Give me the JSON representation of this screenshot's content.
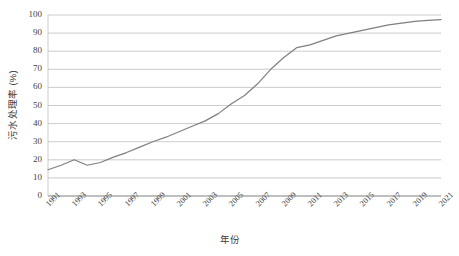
{
  "chart_data": {
    "type": "line",
    "title": "",
    "xlabel": "年份",
    "ylabel": "污水处理率 (%)",
    "ylim": [
      0,
      100
    ],
    "ytick_step": 10,
    "yticks": [
      100,
      90,
      80,
      70,
      60,
      50,
      40,
      30,
      20,
      10,
      0
    ],
    "xticks": [
      "1991",
      "1993",
      "1995",
      "1997",
      "1999",
      "2001",
      "2003",
      "2005",
      "2007",
      "2009",
      "2011",
      "2013",
      "2015",
      "2017",
      "2019",
      "2021"
    ],
    "xlim": [
      1991,
      2021
    ],
    "grid": "horizontal",
    "legend": "none",
    "series": [
      {
        "name": "污水处理率",
        "color": "#7f7f7f",
        "x": [
          1991,
          1992,
          1993,
          1994,
          1995,
          1996,
          1997,
          1998,
          1999,
          2000,
          2001,
          2002,
          2003,
          2004,
          2005,
          2006,
          2007,
          2008,
          2009,
          2010,
          2011,
          2012,
          2013,
          2014,
          2015,
          2016,
          2017,
          2018,
          2019,
          2020,
          2021
        ],
        "values": [
          14.5,
          17.0,
          20.0,
          17.0,
          18.5,
          21.5,
          24.0,
          27.0,
          30.0,
          32.5,
          35.5,
          38.5,
          41.5,
          45.5,
          51.0,
          55.5,
          62.0,
          70.0,
          76.5,
          82.0,
          83.5,
          86.0,
          88.5,
          90.0,
          91.5,
          93.0,
          94.5,
          95.5,
          96.5,
          97.0,
          97.5
        ]
      }
    ]
  },
  "axis_colors": {
    "grid": "#bfbfbf",
    "axis": "#808080",
    "line": "#7f7f7f",
    "text": "#3f3f3f"
  }
}
